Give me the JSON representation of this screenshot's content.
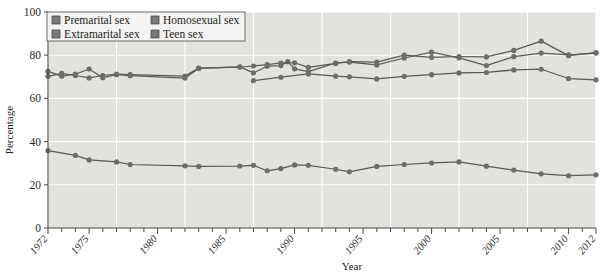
{
  "chart_data": {
    "type": "line",
    "title": "",
    "xlabel": "Year",
    "ylabel": "Percentage",
    "xlim": [
      1972,
      2012
    ],
    "ylim": [
      0,
      100
    ],
    "grid": true,
    "legend_position": "top-left",
    "ytick_labels": [
      "0",
      "20",
      "40",
      "60",
      "80",
      "100"
    ],
    "ytick_values": [
      0,
      20,
      40,
      60,
      80,
      100
    ],
    "xtick_labels": [
      "1972",
      "1975",
      "1980",
      "1985",
      "1990",
      "1995",
      "2000",
      "2005",
      "2010",
      "2012"
    ],
    "xtick_values": [
      1972,
      1975,
      1980,
      1985,
      1990,
      1995,
      2000,
      2005,
      2010,
      2012
    ],
    "minor_xticks_every": 1,
    "colors": {
      "line": "#5a5a58",
      "marker": "#6d6d6b",
      "plot_background": "#e2e2de",
      "gridline": "#ffffff",
      "axis": "#4a4a46"
    },
    "series": [
      {
        "name": "Premarital sex",
        "legend_swatch": "#7a7a78",
        "points": [
          [
            1972,
            72.5
          ],
          [
            1973,
            70.3
          ],
          [
            1974,
            71.2
          ],
          [
            1975,
            73.6
          ],
          [
            1976,
            69.6
          ],
          [
            1977,
            71.0
          ],
          [
            1978,
            70.5
          ],
          [
            1982,
            69.4
          ],
          [
            1983,
            73.9
          ],
          [
            1986,
            74.6
          ],
          [
            1987,
            71.8
          ],
          [
            1988,
            74.9
          ],
          [
            1989,
            75.2
          ],
          [
            1990,
            73.7
          ],
          [
            1991,
            72.4
          ],
          [
            1993,
            76.4
          ],
          [
            1994,
            76.8
          ],
          [
            1996,
            75.5
          ],
          [
            1998,
            78.7
          ],
          [
            1989.5,
            77.0
          ],
          [
            2000,
            81.4
          ],
          [
            2002,
            78.8
          ],
          [
            2004,
            75.2
          ],
          [
            2006,
            79.3
          ],
          [
            2008,
            81.0
          ],
          [
            2010,
            80.2
          ],
          [
            2012,
            81.0
          ]
        ]
      },
      {
        "name": "Extramarital sex",
        "legend_swatch": "#7a7a78",
        "points": [
          [
            1972,
            70.2
          ],
          [
            1973,
            71.6
          ],
          [
            1974,
            70.6
          ],
          [
            1975,
            69.5
          ],
          [
            1976,
            70.6
          ],
          [
            1977,
            71.2
          ],
          [
            1978,
            71.0
          ],
          [
            1982,
            70.3
          ],
          [
            1983,
            74.0
          ],
          [
            1986,
            74.5
          ],
          [
            1987,
            75.0
          ],
          [
            1988,
            75.6
          ],
          [
            1989,
            76.4
          ],
          [
            1990,
            76.5
          ],
          [
            1991,
            74.4
          ],
          [
            1993,
            76.2
          ],
          [
            1994,
            77.0
          ],
          [
            1996,
            76.8
          ],
          [
            1998,
            80.0
          ],
          [
            2000,
            79.0
          ],
          [
            2002,
            79.4
          ],
          [
            2004,
            79.2
          ],
          [
            2006,
            82.2
          ],
          [
            2008,
            86.5
          ],
          [
            2010,
            79.8
          ],
          [
            2012,
            81.2
          ]
        ]
      },
      {
        "name": "Homosexual sex",
        "legend_swatch": "#7a7a78",
        "points": [
          [
            1987,
            68.2
          ],
          [
            1989,
            69.8
          ],
          [
            1991,
            71.3
          ],
          [
            1993,
            70.3
          ],
          [
            1994,
            70.0
          ],
          [
            1996,
            69.0
          ],
          [
            1998,
            70.2
          ],
          [
            2000,
            71.0
          ],
          [
            2002,
            71.8
          ],
          [
            2004,
            72.0
          ],
          [
            2006,
            73.2
          ],
          [
            2008,
            73.5
          ],
          [
            2010,
            69.2
          ],
          [
            2012,
            68.6
          ]
        ]
      },
      {
        "name": "Teen sex",
        "legend_swatch": "#7a7a78",
        "points": [
          [
            1972,
            35.8
          ],
          [
            1974,
            33.6
          ],
          [
            1975,
            31.5
          ],
          [
            1977,
            30.6
          ],
          [
            1978,
            29.4
          ],
          [
            1982,
            28.8
          ],
          [
            1983,
            28.5
          ],
          [
            1986,
            28.7
          ],
          [
            1987,
            29.0
          ],
          [
            1988,
            26.5
          ],
          [
            1989,
            27.5
          ],
          [
            1990,
            29.2
          ],
          [
            1991,
            29.0
          ],
          [
            1993,
            27.2
          ],
          [
            1994,
            26.0
          ],
          [
            1996,
            28.5
          ],
          [
            1998,
            29.4
          ],
          [
            2000,
            30.1
          ],
          [
            2002,
            30.6
          ],
          [
            2004,
            28.6
          ],
          [
            2006,
            26.8
          ],
          [
            2008,
            25.1
          ],
          [
            2010,
            24.2
          ],
          [
            2012,
            24.6
          ]
        ]
      }
    ]
  },
  "legend": {
    "entries": [
      {
        "label": "Premarital sex"
      },
      {
        "label": "Homosexual sex"
      },
      {
        "label": "Extramarital sex"
      },
      {
        "label": "Teen sex"
      }
    ]
  }
}
